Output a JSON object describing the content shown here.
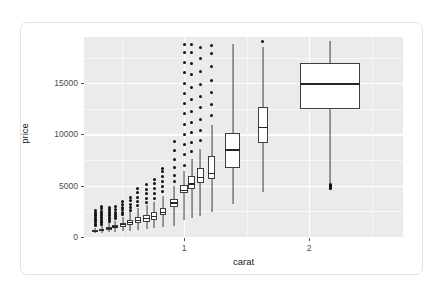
{
  "figure": {
    "background": "#ffffff",
    "card_border": "#e2e2e2",
    "panel_fill": "#ebebeb",
    "grid_color": "#ffffff",
    "box_stroke": "#3d3d3d",
    "box_fill": "#ffffff",
    "outlier_color": "#111111",
    "axis_text_color": "#4d4d4d"
  },
  "chart_data": {
    "type": "box",
    "title": "",
    "subtitle": "",
    "xlabel": "carat",
    "ylabel": "price",
    "xlim": [
      0.2,
      2.75
    ],
    "ylim": [
      0,
      19500
    ],
    "xticks": [
      1,
      2
    ],
    "xtick_labels": [
      "1",
      "2"
    ],
    "yticks": [
      0,
      5000,
      10000,
      15000
    ],
    "ytick_labels": [
      "0",
      "5000",
      "10000",
      "15000"
    ],
    "grid": "major-and-minor-white-on-grey",
    "legend": "none",
    "legend_position": "none",
    "boxes": [
      {
        "x": 0.29,
        "width": 0.045,
        "lower_whisker": 357,
        "q1": 460,
        "median": 540,
        "q3": 670,
        "upper_whisker": 900,
        "outliers": [
          1100,
          1250,
          1400,
          1600,
          1750,
          1900,
          2050,
          2200,
          2400,
          2600
        ]
      },
      {
        "x": 0.34,
        "width": 0.045,
        "lower_whisker": 400,
        "q1": 560,
        "median": 650,
        "q3": 790,
        "upper_whisker": 1050,
        "outliers": [
          1200,
          1380,
          1550,
          1720,
          1900,
          2080,
          2260,
          2500,
          2750,
          3000
        ]
      },
      {
        "x": 0.4,
        "width": 0.045,
        "lower_whisker": 450,
        "q1": 700,
        "median": 820,
        "q3": 980,
        "upper_whisker": 1350,
        "outliers": [
          1500,
          1700,
          1900,
          2100,
          2300,
          2500,
          2700,
          2900
        ]
      },
      {
        "x": 0.45,
        "width": 0.045,
        "lower_whisker": 500,
        "q1": 830,
        "median": 970,
        "q3": 1150,
        "upper_whisker": 1600,
        "outliers": [
          1800,
          2000,
          2200,
          2400,
          2700,
          3000
        ]
      },
      {
        "x": 0.51,
        "width": 0.045,
        "lower_whisker": 550,
        "q1": 1000,
        "median": 1180,
        "q3": 1400,
        "upper_whisker": 1950,
        "outliers": [
          2150,
          2400,
          2650,
          2900,
          3200,
          3500
        ]
      },
      {
        "x": 0.57,
        "width": 0.045,
        "lower_whisker": 620,
        "q1": 1180,
        "median": 1400,
        "q3": 1700,
        "upper_whisker": 2400,
        "outliers": [
          2600,
          2900,
          3200,
          3550,
          3900
        ]
      },
      {
        "x": 0.63,
        "width": 0.045,
        "lower_whisker": 700,
        "q1": 1350,
        "median": 1600,
        "q3": 1950,
        "upper_whisker": 2800,
        "outliers": [
          3100,
          3500,
          3900,
          4300,
          4700
        ]
      },
      {
        "x": 0.7,
        "width": 0.05,
        "lower_whisker": 800,
        "q1": 1500,
        "median": 1800,
        "q3": 2150,
        "upper_whisker": 3100,
        "outliers": [
          3400,
          3800,
          4200,
          4600,
          5100
        ]
      },
      {
        "x": 0.76,
        "width": 0.05,
        "lower_whisker": 900,
        "q1": 1700,
        "median": 2000,
        "q3": 2400,
        "upper_whisker": 3400,
        "outliers": [
          3800,
          4200,
          4700,
          5200,
          5600
        ]
      },
      {
        "x": 0.83,
        "width": 0.05,
        "lower_whisker": 1000,
        "q1": 2100,
        "median": 2400,
        "q3": 2850,
        "upper_whisker": 4000,
        "outliers": [
          4400,
          4900,
          5400,
          5900,
          6400,
          6700
        ]
      },
      {
        "x": 0.92,
        "width": 0.06,
        "lower_whisker": 1050,
        "q1": 2900,
        "median": 3300,
        "q3": 3750,
        "upper_whisker": 5000,
        "outliers": [
          5400,
          6000,
          6800,
          7600,
          8400,
          9300
        ]
      },
      {
        "x": 1.0,
        "width": 0.06,
        "lower_whisker": 1700,
        "q1": 4250,
        "median": 4550,
        "q3": 5050,
        "upper_whisker": 6400,
        "outliers": [
          7000,
          8000,
          9000,
          10000,
          11000,
          12000,
          13000,
          14000,
          15000,
          16000,
          17000,
          18000,
          18800
        ]
      },
      {
        "x": 1.06,
        "width": 0.055,
        "lower_whisker": 1850,
        "q1": 4650,
        "median": 5150,
        "q3": 5900,
        "upper_whisker": 7600,
        "outliers": [
          8300,
          9200,
          10200,
          11200,
          12200,
          13400,
          14600,
          15800,
          16900,
          18000,
          18800
        ]
      },
      {
        "x": 1.13,
        "width": 0.055,
        "lower_whisker": 2000,
        "q1": 5300,
        "median": 5800,
        "q3": 6700,
        "upper_whisker": 8600,
        "outliers": [
          9400,
          10400,
          11500,
          12600,
          13700,
          14900,
          16100,
          17400,
          18500
        ]
      },
      {
        "x": 1.22,
        "width": 0.06,
        "lower_whisker": 2450,
        "q1": 5700,
        "median": 6200,
        "q3": 7900,
        "upper_whisker": 10900,
        "outliers": [
          11800,
          12900,
          14100,
          15300,
          16600,
          17900,
          18700
        ]
      },
      {
        "x": 1.39,
        "width": 0.12,
        "lower_whisker": 3250,
        "q1": 6700,
        "median": 8500,
        "q3": 10100,
        "upper_whisker": 18800,
        "outliers": []
      },
      {
        "x": 1.63,
        "width": 0.085,
        "lower_whisker": 4400,
        "q1": 9150,
        "median": 10700,
        "q3": 12700,
        "upper_whisker": 18500,
        "outliers": [
          19100
        ]
      },
      {
        "x": 2.17,
        "width": 0.48,
        "lower_whisker": 4600,
        "q1": 12450,
        "median": 14900,
        "q3": 17000,
        "upper_whisker": 19100,
        "outliers": [
          4700,
          4800,
          4900,
          5000,
          5100
        ]
      }
    ]
  }
}
